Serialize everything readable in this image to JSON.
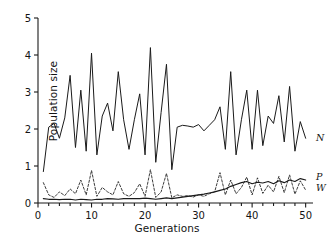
{
  "chart_data": {
    "type": "line",
    "title": "",
    "xlabel": "Generations",
    "ylabel": "Population size",
    "xlim": [
      0,
      51
    ],
    "ylim": [
      0,
      5
    ],
    "xticks": [
      0,
      10,
      20,
      30,
      40,
      50
    ],
    "yticks": [
      0,
      1,
      2,
      3,
      4,
      5
    ],
    "grid": false,
    "legend_position": "right-edge-inline",
    "line_color": "#1a1a1a",
    "axis_color": "#1a1a1a",
    "background_color": "#ffffff",
    "x": [
      1,
      2,
      3,
      4,
      5,
      6,
      7,
      8,
      9,
      10,
      11,
      12,
      13,
      14,
      15,
      16,
      17,
      18,
      19,
      20,
      21,
      22,
      23,
      24,
      25,
      26,
      27,
      28,
      29,
      30,
      31,
      32,
      33,
      34,
      35,
      36,
      37,
      38,
      39,
      40,
      41,
      42,
      43,
      44,
      45,
      46,
      47,
      48,
      49,
      50
    ],
    "series": [
      {
        "name": "N",
        "label": "N",
        "style": "solid",
        "values": [
          0.85,
          2.05,
          2.15,
          1.75,
          2.3,
          3.45,
          1.5,
          3.05,
          1.4,
          4.05,
          1.3,
          2.35,
          2.7,
          1.95,
          3.55,
          2.25,
          1.45,
          2.25,
          2.95,
          1.3,
          4.2,
          1.1,
          2.45,
          3.75,
          0.9,
          2.05,
          2.1,
          2.08,
          2.05,
          2.12,
          1.95,
          2.1,
          2.25,
          2.6,
          1.45,
          3.55,
          1.3,
          2.25,
          3.05,
          1.45,
          3.05,
          1.55,
          2.35,
          2.15,
          2.9,
          1.65,
          3.15,
          1.4,
          2.2,
          1.75
        ]
      },
      {
        "name": "P",
        "label": "P",
        "style": "solid-thick-low",
        "values": [
          0.12,
          0.1,
          0.1,
          0.09,
          0.1,
          0.1,
          0.08,
          0.1,
          0.09,
          0.08,
          0.1,
          0.1,
          0.12,
          0.11,
          0.1,
          0.12,
          0.12,
          0.12,
          0.12,
          0.13,
          0.12,
          0.1,
          0.12,
          0.14,
          0.12,
          0.14,
          0.16,
          0.18,
          0.2,
          0.22,
          0.24,
          0.27,
          0.3,
          0.34,
          0.38,
          0.45,
          0.5,
          0.55,
          0.58,
          0.52,
          0.56,
          0.54,
          0.58,
          0.52,
          0.6,
          0.55,
          0.62,
          0.58,
          0.66,
          0.62
        ]
      },
      {
        "name": "W",
        "label": "W",
        "style": "dashed",
        "values": [
          0.55,
          0.22,
          0.15,
          0.3,
          0.2,
          0.38,
          0.25,
          0.62,
          0.22,
          0.88,
          0.18,
          0.42,
          0.3,
          0.22,
          0.58,
          0.25,
          0.18,
          0.28,
          0.52,
          0.18,
          0.9,
          0.15,
          0.3,
          0.8,
          0.14,
          0.22,
          0.18,
          0.2,
          0.16,
          0.22,
          0.18,
          0.25,
          0.3,
          0.82,
          0.22,
          0.62,
          0.25,
          0.42,
          0.7,
          0.22,
          0.68,
          0.26,
          0.48,
          0.3,
          0.72,
          0.28,
          0.76,
          0.24,
          0.6,
          0.35
        ]
      }
    ]
  },
  "axes": {
    "x_title": "Generations",
    "y_title": "Population size",
    "x_tick_labels": [
      "0",
      "10",
      "20",
      "30",
      "40",
      "50"
    ],
    "y_tick_labels": [
      "0",
      "1",
      "2",
      "3",
      "4",
      "5"
    ]
  },
  "series_labels": {
    "n": "N",
    "p": "P",
    "w": "W"
  }
}
